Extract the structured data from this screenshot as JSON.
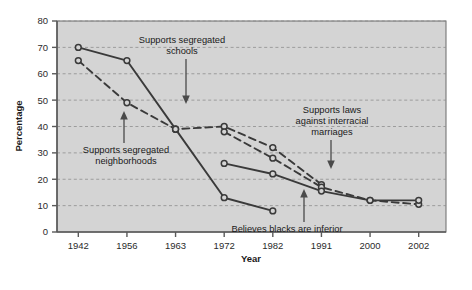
{
  "chart_data": {
    "type": "line",
    "title": "",
    "xlabel": "Year",
    "ylabel": "Percentage",
    "categories": [
      "1942",
      "1956",
      "1963",
      "1972",
      "1982",
      "1991",
      "2000",
      "2002"
    ],
    "ylim": [
      0,
      80
    ],
    "yticks": [
      "0",
      "10",
      "20",
      "30",
      "40",
      "50",
      "60",
      "70",
      "80"
    ],
    "grid": true,
    "legend_position": "none",
    "series": [
      {
        "name": "Supports segregated schools",
        "style": "solid",
        "x": [
          "1942",
          "1956",
          "1963",
          "1972",
          "1982",
          "1991",
          "2000",
          "2002"
        ],
        "values": [
          70,
          65,
          39,
          null,
          null,
          null,
          null,
          null
        ]
      },
      {
        "name": "Supports segregated neighborhoods",
        "style": "dashed",
        "x": [
          "1942",
          "1956",
          "1963",
          "1972",
          "1982",
          "1991",
          "2000",
          "2002"
        ],
        "values": [
          65,
          49,
          39,
          40,
          32,
          18,
          null,
          null
        ]
      },
      {
        "name": "Supports laws against interracial marriages",
        "style": "dashed",
        "x": [
          "1942",
          "1956",
          "1963",
          "1972",
          "1982",
          "1991",
          "2000",
          "2002"
        ],
        "values": [
          null,
          null,
          null,
          38,
          28,
          17,
          12,
          10.5
        ]
      },
      {
        "name": "Believes blacks are inferior",
        "style": "solid",
        "x": [
          "1942",
          "1956",
          "1963",
          "1972",
          "1982",
          "1991",
          "2000",
          "2002"
        ],
        "values": [
          null,
          null,
          null,
          26,
          22,
          15.5,
          12,
          12
        ]
      },
      {
        "name": "Supports segregated schools continued",
        "style": "solid",
        "x": [
          "1942",
          "1956",
          "1963",
          "1972",
          "1982",
          "1991",
          "2000",
          "2002"
        ],
        "values": [
          null,
          null,
          39,
          13,
          8,
          null,
          null,
          null
        ]
      }
    ],
    "annotations": [
      {
        "id": "schools",
        "lines": [
          "Supports segregated",
          "schools"
        ],
        "text": "Supports segregated schools"
      },
      {
        "id": "neighborhoods",
        "lines": [
          "Supports segregated",
          "neighborhoods"
        ],
        "text": "Supports segregated neighborhoods"
      },
      {
        "id": "interracial",
        "lines": [
          "Supports laws",
          "against interracial",
          "marriages"
        ],
        "text": "Supports laws against interracial marriages"
      },
      {
        "id": "inferior",
        "lines": [
          "Believes blacks are inferior"
        ],
        "text": "Believes blacks are inferior"
      }
    ],
    "colors": {
      "plot_background": "#d4d4d4",
      "line": "#3a3a3a",
      "grid": "#9a9a9a",
      "axis": "#555555",
      "text": "#1a1a1a",
      "page_background": "#ffffff"
    }
  }
}
